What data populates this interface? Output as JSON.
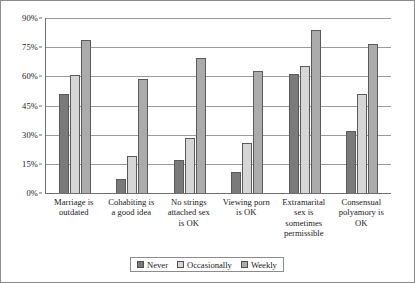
{
  "chart_data": {
    "type": "bar",
    "title": "",
    "xlabel": "",
    "ylabel": "",
    "ylim": [
      0,
      90
    ],
    "grid": true,
    "legend_position": "bottom",
    "ytick_labels": [
      "0%",
      "15%",
      "30%",
      "45%",
      "60%",
      "75%",
      "90%"
    ],
    "ytick_values": [
      0,
      15,
      30,
      45,
      60,
      75,
      90
    ],
    "categories": [
      "Marriage is outdated",
      "Cohabiting is a good idea",
      "No strings attached sex is OK",
      "Viewing porn is OK",
      "Extramarital sex is sometimes permissible",
      "Consensual polyamory is OK"
    ],
    "category_lines": [
      [
        "Marriage is",
        "outdated"
      ],
      [
        "Cohabiting is",
        "a good idea"
      ],
      [
        "No strings",
        "attached sex",
        "is OK"
      ],
      [
        "Viewing porn",
        "is OK"
      ],
      [
        "Extramarital",
        "sex is",
        "sometimes",
        "permissible"
      ],
      [
        "Consensual",
        "polyamory is",
        "OK"
      ]
    ],
    "series": [
      {
        "name": "Never",
        "color": "#7a7a7a",
        "values": [
          51,
          7,
          17,
          11,
          61,
          32
        ]
      },
      {
        "name": "Occasionally",
        "color": "#d6d6d6",
        "values": [
          60.5,
          19,
          28.5,
          25.5,
          65.5,
          51
        ]
      },
      {
        "name": "Weekly",
        "color": "#ababab",
        "values": [
          78.5,
          58.5,
          69.5,
          63,
          84,
          76.5
        ]
      }
    ]
  }
}
